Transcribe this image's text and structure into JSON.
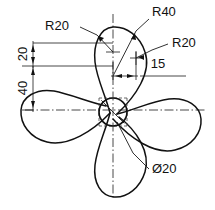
{
  "drawing": {
    "title": "Four-blade fan impeller orthographic view",
    "subject": "fan-impeller",
    "blade_count": 4,
    "line_color": "#111111",
    "background_color": "#ffffff",
    "annotations": [
      {
        "id": "r20-left",
        "label": "R20",
        "type": "radius",
        "value": 20,
        "x": 57,
        "y": 30
      },
      {
        "id": "r40-top",
        "label": "R40",
        "type": "radius",
        "value": 40,
        "x": 152,
        "y": 16
      },
      {
        "id": "r20-right",
        "label": "R20",
        "type": "radius",
        "value": 20,
        "x": 172,
        "y": 47
      },
      {
        "id": "dim-20",
        "label": "20",
        "type": "linear",
        "value": 20,
        "x": 24,
        "y": 54
      },
      {
        "id": "dim-40",
        "label": "40",
        "type": "linear",
        "value": 40,
        "x": 24,
        "y": 88
      },
      {
        "id": "dim-15",
        "label": "15",
        "type": "linear",
        "value": 15,
        "x": 158,
        "y": 78
      },
      {
        "id": "dia-20",
        "label": "Ø20",
        "type": "diameter",
        "value": 20,
        "x": 152,
        "y": 172
      }
    ],
    "labels": {
      "r20_left": "R20",
      "r40_top": "R40",
      "r20_right": "R20",
      "dim_20": "20",
      "dim_40": "40",
      "dim_15": "15",
      "dia_20": "Ø20"
    }
  }
}
